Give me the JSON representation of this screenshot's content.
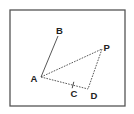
{
  "diagram": {
    "type": "geometry-figure",
    "frame": {
      "x": 10,
      "y": 10,
      "width": 115,
      "height": 96
    },
    "points": [
      {
        "id": "A",
        "label": "A",
        "x": 41,
        "y": 77,
        "label_x": 30.5,
        "label_y": 81.5
      },
      {
        "id": "B",
        "label": "B",
        "x": 58,
        "y": 36,
        "label_x": 56,
        "label_y": 34
      },
      {
        "id": "P",
        "label": "P",
        "x": 102,
        "y": 49,
        "label_x": 103.5,
        "label_y": 51
      },
      {
        "id": "C",
        "label": "C",
        "x": 73,
        "y": 85,
        "label_x": 70.5,
        "label_y": 96.5
      },
      {
        "id": "D",
        "label": "D",
        "x": 88,
        "y": 89,
        "label_x": 90.5,
        "label_y": 99
      }
    ],
    "segments": [
      {
        "from": "A",
        "to": "B",
        "style": "solid"
      },
      {
        "from": "A",
        "to": "P",
        "style": "dashed"
      },
      {
        "from": "P",
        "to": "D",
        "style": "dashed"
      },
      {
        "from": "A",
        "to": "D",
        "style": "dashed"
      }
    ],
    "marks": [
      {
        "type": "tick",
        "at": "C",
        "on_segment": "AD"
      }
    ],
    "colors": {
      "frame": "#555555",
      "line": "#444444",
      "label": "#222222",
      "background": "#ffffff"
    }
  }
}
